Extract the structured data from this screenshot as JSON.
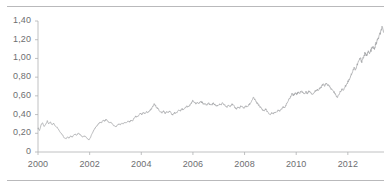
{
  "chart_data": {
    "type": "line",
    "title": "",
    "subtitle": "",
    "xlabel": "",
    "ylabel": "",
    "grid": false,
    "legend": false,
    "legend_position": "none",
    "decimal_separator": ",",
    "line_color": "#9d9fa2",
    "axis_color": "#b0b1b3",
    "tick_label_color": "#6d6e71",
    "xlim": [
      2000.0,
      2013.4
    ],
    "ylim": [
      0,
      1.4
    ],
    "ytick_labels": [
      "1,40",
      "1,20",
      "1,00",
      "0,80",
      "0,60",
      "0,40",
      "0,20",
      "0"
    ],
    "ytick_values": [
      1.4,
      1.2,
      1.0,
      0.8,
      0.6,
      0.4,
      0.2,
      0
    ],
    "xtick_labels": [
      "2000",
      "2002",
      "2004",
      "2006",
      "2008",
      "2010",
      "2012"
    ],
    "xtick_values": [
      2000,
      2002,
      2004,
      2006,
      2008,
      2010,
      2012
    ],
    "x": [
      2000.0,
      2000.06,
      2000.12,
      2000.18,
      2000.24,
      2000.3,
      2000.36,
      2000.42,
      2000.48,
      2000.54,
      2000.6,
      2000.66,
      2000.72,
      2000.78,
      2000.84,
      2000.9,
      2000.96,
      2001.02,
      2001.08,
      2001.14,
      2001.2,
      2001.26,
      2001.32,
      2001.38,
      2001.44,
      2001.5,
      2001.56,
      2001.62,
      2001.68,
      2001.74,
      2001.8,
      2001.86,
      2001.92,
      2001.98,
      2002.04,
      2002.1,
      2002.16,
      2002.22,
      2002.28,
      2002.34,
      2002.4,
      2002.46,
      2002.52,
      2002.58,
      2002.64,
      2002.7,
      2002.76,
      2002.82,
      2002.88,
      2002.94,
      2003.0,
      2003.06,
      2003.12,
      2003.18,
      2003.24,
      2003.3,
      2003.36,
      2003.42,
      2003.48,
      2003.54,
      2003.6,
      2003.66,
      2003.72,
      2003.78,
      2003.84,
      2003.9,
      2003.96,
      2004.02,
      2004.08,
      2004.14,
      2004.2,
      2004.26,
      2004.32,
      2004.38,
      2004.44,
      2004.5,
      2004.56,
      2004.62,
      2004.68,
      2004.74,
      2004.8,
      2004.86,
      2004.92,
      2004.98,
      2005.04,
      2005.1,
      2005.16,
      2005.22,
      2005.28,
      2005.34,
      2005.4,
      2005.46,
      2005.52,
      2005.58,
      2005.64,
      2005.7,
      2005.76,
      2005.82,
      2005.88,
      2005.94,
      2006.0,
      2006.06,
      2006.12,
      2006.18,
      2006.24,
      2006.3,
      2006.36,
      2006.42,
      2006.48,
      2006.54,
      2006.6,
      2006.66,
      2006.72,
      2006.78,
      2006.84,
      2006.9,
      2006.96,
      2007.02,
      2007.08,
      2007.14,
      2007.2,
      2007.26,
      2007.32,
      2007.38,
      2007.44,
      2007.5,
      2007.56,
      2007.62,
      2007.68,
      2007.74,
      2007.8,
      2007.86,
      2007.92,
      2007.98,
      2008.04,
      2008.1,
      2008.16,
      2008.22,
      2008.28,
      2008.34,
      2008.4,
      2008.46,
      2008.52,
      2008.58,
      2008.64,
      2008.7,
      2008.76,
      2008.82,
      2008.88,
      2008.94,
      2009.0,
      2009.06,
      2009.12,
      2009.18,
      2009.24,
      2009.3,
      2009.36,
      2009.42,
      2009.48,
      2009.54,
      2009.6,
      2009.66,
      2009.72,
      2009.78,
      2009.84,
      2009.9,
      2009.96,
      2010.02,
      2010.08,
      2010.14,
      2010.2,
      2010.26,
      2010.32,
      2010.38,
      2010.44,
      2010.5,
      2010.56,
      2010.62,
      2010.68,
      2010.74,
      2010.8,
      2010.86,
      2010.92,
      2010.98,
      2011.04,
      2011.1,
      2011.16,
      2011.22,
      2011.28,
      2011.34,
      2011.4,
      2011.46,
      2011.52,
      2011.58,
      2011.64,
      2011.7,
      2011.76,
      2011.82,
      2011.88,
      2011.94,
      2012.0,
      2012.06,
      2012.12,
      2012.18,
      2012.24,
      2012.3,
      2012.36,
      2012.42,
      2012.48,
      2012.54,
      2012.6,
      2012.66,
      2012.72,
      2012.78,
      2012.84,
      2012.9,
      2012.96,
      2013.02,
      2013.08,
      2013.14,
      2013.2,
      2013.26,
      2013.32,
      2013.38
    ],
    "y": [
      0.26,
      0.23,
      0.29,
      0.31,
      0.27,
      0.3,
      0.33,
      0.3,
      0.32,
      0.29,
      0.31,
      0.28,
      0.27,
      0.25,
      0.22,
      0.2,
      0.18,
      0.15,
      0.14,
      0.16,
      0.15,
      0.17,
      0.16,
      0.18,
      0.19,
      0.18,
      0.2,
      0.19,
      0.17,
      0.16,
      0.17,
      0.16,
      0.14,
      0.13,
      0.16,
      0.2,
      0.23,
      0.26,
      0.28,
      0.3,
      0.32,
      0.31,
      0.34,
      0.33,
      0.35,
      0.33,
      0.31,
      0.32,
      0.3,
      0.28,
      0.27,
      0.28,
      0.3,
      0.29,
      0.31,
      0.3,
      0.32,
      0.31,
      0.33,
      0.32,
      0.34,
      0.33,
      0.36,
      0.38,
      0.37,
      0.39,
      0.41,
      0.4,
      0.42,
      0.41,
      0.43,
      0.42,
      0.44,
      0.46,
      0.48,
      0.51,
      0.49,
      0.47,
      0.45,
      0.43,
      0.42,
      0.44,
      0.41,
      0.43,
      0.42,
      0.44,
      0.41,
      0.4,
      0.42,
      0.41,
      0.43,
      0.45,
      0.44,
      0.46,
      0.45,
      0.47,
      0.49,
      0.48,
      0.5,
      0.52,
      0.55,
      0.53,
      0.51,
      0.53,
      0.52,
      0.54,
      0.53,
      0.51,
      0.52,
      0.5,
      0.52,
      0.51,
      0.5,
      0.52,
      0.51,
      0.49,
      0.5,
      0.51,
      0.5,
      0.52,
      0.51,
      0.49,
      0.48,
      0.5,
      0.49,
      0.51,
      0.5,
      0.48,
      0.46,
      0.48,
      0.47,
      0.49,
      0.48,
      0.47,
      0.49,
      0.48,
      0.5,
      0.52,
      0.55,
      0.58,
      0.56,
      0.53,
      0.51,
      0.49,
      0.47,
      0.45,
      0.44,
      0.46,
      0.43,
      0.41,
      0.4,
      0.42,
      0.41,
      0.43,
      0.42,
      0.45,
      0.44,
      0.46,
      0.48,
      0.47,
      0.5,
      0.53,
      0.56,
      0.59,
      0.62,
      0.61,
      0.63,
      0.62,
      0.64,
      0.63,
      0.65,
      0.64,
      0.62,
      0.64,
      0.63,
      0.65,
      0.64,
      0.62,
      0.63,
      0.65,
      0.67,
      0.66,
      0.68,
      0.7,
      0.72,
      0.71,
      0.73,
      0.72,
      0.7,
      0.68,
      0.66,
      0.64,
      0.62,
      0.58,
      0.61,
      0.64,
      0.67,
      0.66,
      0.69,
      0.72,
      0.75,
      0.78,
      0.82,
      0.86,
      0.9,
      0.88,
      0.93,
      0.97,
      1.0,
      0.97,
      1.01,
      1.05,
      1.03,
      1.07,
      1.05,
      1.09,
      1.12,
      1.1,
      1.15,
      1.19,
      1.23,
      1.27,
      1.33,
      1.28
    ]
  }
}
